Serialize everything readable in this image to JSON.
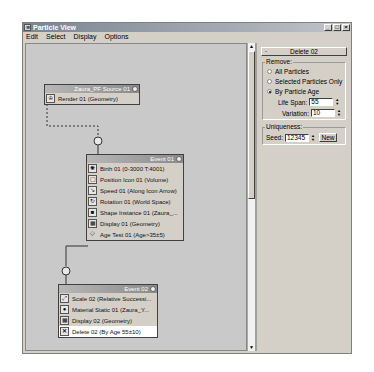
{
  "window": {
    "title": "Particle View",
    "app_icon": "particle-flow-icon",
    "controls": {
      "minimize": "_",
      "maximize": "□",
      "close": "×"
    }
  },
  "menu": [
    "Edit",
    "Select",
    "Display",
    "Options"
  ],
  "graph": {
    "nodes": [
      {
        "id": "source",
        "title": "Zaura_PF Source 01",
        "operators": [
          {
            "label": "Render 01 (Geometry)",
            "icon": "render-icon"
          }
        ]
      },
      {
        "id": "event01",
        "title": "Event 01",
        "operators": [
          {
            "label": "Birth 01 (0-3000 T:4001)",
            "icon": "birth-icon"
          },
          {
            "label": "Position Icon 01 (Volume)",
            "icon": "position-icon"
          },
          {
            "label": "Speed 01 (Along Icon Arrow)",
            "icon": "speed-icon"
          },
          {
            "label": "Rotation 01 (World Space)",
            "icon": "rotation-icon"
          },
          {
            "label": "Shape Instance 01 (Zaura_...",
            "icon": "shape-instance-icon"
          },
          {
            "label": "Display 01 (Geometry)",
            "icon": "display-icon"
          },
          {
            "label": "Age Test 01 (Age>35±5)",
            "icon": "age-test-icon"
          }
        ]
      },
      {
        "id": "event02",
        "title": "Event 02",
        "operators": [
          {
            "label": "Scale 02 (Relative Successi...",
            "icon": "scale-icon"
          },
          {
            "label": "Material Static 01 (Zaura_Y...",
            "icon": "material-icon"
          },
          {
            "label": "Display 02 (Geometry)",
            "icon": "display-icon"
          },
          {
            "label": "Delete 02 (By Age 55±10)",
            "icon": "delete-icon",
            "selected": true
          }
        ]
      }
    ]
  },
  "properties": {
    "rollout_title": "Delete 02",
    "rollout_toggle": "-",
    "remove": {
      "label": "Remove:",
      "options": [
        {
          "label": "All Particles",
          "checked": false
        },
        {
          "label": "Selected Particles Only",
          "checked": false
        },
        {
          "label": "By Particle Age",
          "checked": true
        }
      ],
      "life_span_label": "Life Span:",
      "life_span_value": "55",
      "variation_label": "Variation:",
      "variation_value": "10"
    },
    "uniqueness": {
      "label": "Uniqueness:",
      "seed_label": "Seed:",
      "seed_value": "12345",
      "new_button": "New"
    }
  }
}
